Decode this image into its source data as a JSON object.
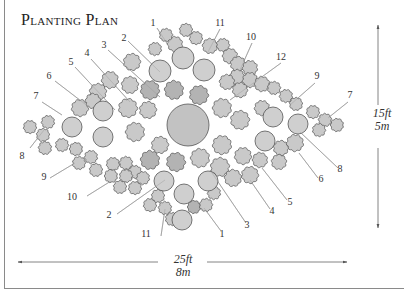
{
  "title": "Planting Plan",
  "dimensions": {
    "width_ft": "25ft",
    "width_m": "8m",
    "height_ft": "15ft",
    "height_m": "5m"
  },
  "colors": {
    "shrub_fill": "#c9c9c9",
    "shrub_dark_fill": "#b3b3b3",
    "circle_fill": "#cfcfcf",
    "outline": "#555555",
    "leader": "#9a9a9a",
    "text": "#333333"
  },
  "labels": [
    {
      "text": "1",
      "x": 153,
      "y": 26,
      "lx1": 157,
      "ly1": 28,
      "lx2": 168,
      "ly2": 45
    },
    {
      "text": "2",
      "x": 124,
      "y": 41,
      "lx1": 128,
      "ly1": 41,
      "lx2": 160,
      "ly2": 72
    },
    {
      "text": "3",
      "x": 104,
      "y": 48,
      "lx1": 108,
      "ly1": 50,
      "lx2": 160,
      "ly2": 97
    },
    {
      "text": "4",
      "x": 87,
      "y": 56,
      "lx1": 91,
      "ly1": 59,
      "lx2": 130,
      "ly2": 102
    },
    {
      "text": "5",
      "x": 71,
      "y": 65,
      "lx1": 75,
      "ly1": 67,
      "lx2": 115,
      "ly2": 110
    },
    {
      "text": "6",
      "x": 49,
      "y": 79,
      "lx1": 55,
      "ly1": 81,
      "lx2": 85,
      "ly2": 104
    },
    {
      "text": "7",
      "x": 36,
      "y": 99,
      "lx1": 42,
      "ly1": 102,
      "lx2": 62,
      "ly2": 115
    },
    {
      "text": "8",
      "x": 22,
      "y": 159,
      "lx1": 30,
      "ly1": 148,
      "lx2": 44,
      "ly2": 130
    },
    {
      "text": "9",
      "x": 44,
      "y": 180,
      "lx1": 50,
      "ly1": 178,
      "lx2": 75,
      "ly2": 163
    },
    {
      "text": "10",
      "x": 72,
      "y": 200,
      "lx1": 87,
      "ly1": 196,
      "lx2": 111,
      "ly2": 181
    },
    {
      "text": "2",
      "x": 109,
      "y": 218,
      "lx1": 117,
      "ly1": 214,
      "lx2": 165,
      "ly2": 180
    },
    {
      "text": "11",
      "x": 146,
      "y": 237,
      "lx1": 161,
      "ly1": 236,
      "lx2": 165,
      "ly2": 209
    },
    {
      "text": "1",
      "x": 222,
      "y": 237,
      "lx1": 221,
      "ly1": 231,
      "lx2": 204,
      "ly2": 208
    },
    {
      "text": "3",
      "x": 247,
      "y": 228,
      "lx1": 246,
      "ly1": 223,
      "lx2": 210,
      "ly2": 170
    },
    {
      "text": "4",
      "x": 272,
      "y": 214,
      "lx1": 270,
      "ly1": 209,
      "lx2": 250,
      "ly2": 180
    },
    {
      "text": "5",
      "x": 290,
      "y": 205,
      "lx1": 287,
      "ly1": 200,
      "lx2": 262,
      "ly2": 168
    },
    {
      "text": "6",
      "x": 321,
      "y": 182,
      "lx1": 318,
      "ly1": 178,
      "lx2": 299,
      "ly2": 153
    },
    {
      "text": "8",
      "x": 340,
      "y": 172,
      "lx1": 338,
      "ly1": 168,
      "lx2": 300,
      "ly2": 132
    },
    {
      "text": "7",
      "x": 350,
      "y": 98,
      "lx1": 348,
      "ly1": 102,
      "lx2": 328,
      "ly2": 118
    },
    {
      "text": "9",
      "x": 317,
      "y": 79,
      "lx1": 315,
      "ly1": 83,
      "lx2": 290,
      "ly2": 105
    },
    {
      "text": "12",
      "x": 281,
      "y": 60,
      "lx1": 281,
      "ly1": 63,
      "lx2": 230,
      "ly2": 100
    },
    {
      "text": "10",
      "x": 251,
      "y": 40,
      "lx1": 252,
      "ly1": 43,
      "lx2": 240,
      "ly2": 70
    },
    {
      "text": "11",
      "x": 220,
      "y": 26,
      "lx1": 220,
      "ly1": 29,
      "lx2": 208,
      "ly2": 52
    }
  ],
  "circles": [
    {
      "cx": 188,
      "cy": 125,
      "r": 21,
      "fill": "#c2c2c2"
    },
    {
      "cx": 160,
      "cy": 71,
      "r": 11
    },
    {
      "cx": 183,
      "cy": 58,
      "r": 11
    },
    {
      "cx": 204,
      "cy": 70,
      "r": 11
    },
    {
      "cx": 72,
      "cy": 127,
      "r": 10
    },
    {
      "cx": 103,
      "cy": 111,
      "r": 10
    },
    {
      "cx": 103,
      "cy": 137,
      "r": 10
    },
    {
      "cx": 164,
      "cy": 181,
      "r": 10
    },
    {
      "cx": 184,
      "cy": 194,
      "r": 10
    },
    {
      "cx": 182,
      "cy": 220,
      "r": 10
    },
    {
      "cx": 208,
      "cy": 181,
      "r": 10
    },
    {
      "cx": 273,
      "cy": 117,
      "r": 10
    },
    {
      "cx": 298,
      "cy": 124,
      "r": 10
    },
    {
      "cx": 265,
      "cy": 141,
      "r": 10
    }
  ],
  "shrubs": [
    {
      "cx": 175,
      "cy": 44,
      "r": 8
    },
    {
      "cx": 166,
      "cy": 35,
      "r": 7
    },
    {
      "cx": 155,
      "cy": 49,
      "r": 7
    },
    {
      "cx": 186,
      "cy": 30,
      "r": 7
    },
    {
      "cx": 196,
      "cy": 38,
      "r": 7
    },
    {
      "cx": 210,
      "cy": 46,
      "r": 8
    },
    {
      "cx": 223,
      "cy": 45,
      "r": 7
    },
    {
      "cx": 230,
      "cy": 56,
      "r": 8
    },
    {
      "cx": 238,
      "cy": 64,
      "r": 8
    },
    {
      "cx": 250,
      "cy": 68,
      "r": 8
    },
    {
      "cx": 237,
      "cy": 77,
      "r": 8
    },
    {
      "cx": 250,
      "cy": 80,
      "r": 8
    },
    {
      "cx": 227,
      "cy": 82,
      "r": 8
    },
    {
      "cx": 240,
      "cy": 90,
      "r": 8
    },
    {
      "cx": 262,
      "cy": 84,
      "r": 8
    },
    {
      "cx": 274,
      "cy": 88,
      "r": 7
    },
    {
      "cx": 286,
      "cy": 96,
      "r": 7
    },
    {
      "cx": 296,
      "cy": 104,
      "r": 7
    },
    {
      "cx": 313,
      "cy": 112,
      "r": 7
    },
    {
      "cx": 325,
      "cy": 120,
      "r": 7
    },
    {
      "cx": 319,
      "cy": 130,
      "r": 7
    },
    {
      "cx": 337,
      "cy": 125,
      "r": 7
    },
    {
      "cx": 132,
      "cy": 62,
      "r": 9
    },
    {
      "cx": 110,
      "cy": 80,
      "r": 9
    },
    {
      "cx": 130,
      "cy": 85,
      "r": 9
    },
    {
      "cx": 150,
      "cy": 90,
      "r": 10,
      "dark": true
    },
    {
      "cx": 174,
      "cy": 90,
      "r": 10,
      "dark": true
    },
    {
      "cx": 199,
      "cy": 95,
      "r": 10,
      "dark": true
    },
    {
      "cx": 222,
      "cy": 108,
      "r": 10
    },
    {
      "cx": 240,
      "cy": 120,
      "r": 10
    },
    {
      "cx": 262,
      "cy": 108,
      "r": 8
    },
    {
      "cx": 98,
      "cy": 92,
      "r": 9
    },
    {
      "cx": 80,
      "cy": 108,
      "r": 9
    },
    {
      "cx": 93,
      "cy": 101,
      "r": 8
    },
    {
      "cx": 128,
      "cy": 108,
      "r": 10
    },
    {
      "cx": 135,
      "cy": 132,
      "r": 10
    },
    {
      "cx": 148,
      "cy": 110,
      "r": 9
    },
    {
      "cx": 48,
      "cy": 122,
      "r": 7
    },
    {
      "cx": 43,
      "cy": 135,
      "r": 7
    },
    {
      "cx": 30,
      "cy": 127,
      "r": 7
    },
    {
      "cx": 45,
      "cy": 148,
      "r": 7
    },
    {
      "cx": 62,
      "cy": 145,
      "r": 7
    },
    {
      "cx": 76,
      "cy": 149,
      "r": 7
    },
    {
      "cx": 79,
      "cy": 163,
      "r": 7
    },
    {
      "cx": 91,
      "cy": 157,
      "r": 7
    },
    {
      "cx": 96,
      "cy": 170,
      "r": 7
    },
    {
      "cx": 113,
      "cy": 164,
      "r": 7
    },
    {
      "cx": 126,
      "cy": 163,
      "r": 7
    },
    {
      "cx": 135,
      "cy": 172,
      "r": 7
    },
    {
      "cx": 111,
      "cy": 176,
      "r": 7
    },
    {
      "cx": 126,
      "cy": 176,
      "r": 7
    },
    {
      "cx": 143,
      "cy": 178,
      "r": 7
    },
    {
      "cx": 120,
      "cy": 187,
      "r": 7
    },
    {
      "cx": 135,
      "cy": 188,
      "r": 7
    },
    {
      "cx": 150,
      "cy": 160,
      "r": 10,
      "dark": true
    },
    {
      "cx": 176,
      "cy": 162,
      "r": 10,
      "dark": true
    },
    {
      "cx": 200,
      "cy": 158,
      "r": 10
    },
    {
      "cx": 160,
      "cy": 145,
      "r": 9
    },
    {
      "cx": 222,
      "cy": 145,
      "r": 10
    },
    {
      "cx": 220,
      "cy": 167,
      "r": 10
    },
    {
      "cx": 243,
      "cy": 156,
      "r": 9
    },
    {
      "cx": 233,
      "cy": 178,
      "r": 9
    },
    {
      "cx": 250,
      "cy": 175,
      "r": 9
    },
    {
      "cx": 260,
      "cy": 160,
      "r": 8
    },
    {
      "cx": 281,
      "cy": 148,
      "r": 8
    },
    {
      "cx": 295,
      "cy": 143,
      "r": 9
    },
    {
      "cx": 279,
      "cy": 162,
      "r": 8
    },
    {
      "cx": 150,
      "cy": 205,
      "r": 7
    },
    {
      "cx": 165,
      "cy": 208,
      "r": 7
    },
    {
      "cx": 172,
      "cy": 219,
      "r": 7
    },
    {
      "cx": 194,
      "cy": 207,
      "r": 7,
      "dark": true
    },
    {
      "cx": 206,
      "cy": 205,
      "r": 7
    },
    {
      "cx": 214,
      "cy": 193,
      "r": 7
    },
    {
      "cx": 158,
      "cy": 196,
      "r": 7
    }
  ],
  "arrows": {
    "horizontal": {
      "x1": 18,
      "x2": 347,
      "y": 262
    },
    "vertical": {
      "x": 378,
      "y1": 25,
      "y2": 228
    }
  }
}
